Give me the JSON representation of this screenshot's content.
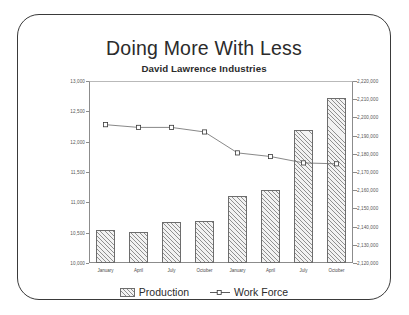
{
  "chart_data": {
    "type": "bar",
    "title": "Doing More With Less",
    "subtitle": "David Lawrence Industries",
    "xlabel": "",
    "ylabel": "",
    "grid": false,
    "legend_position": "bottom",
    "categories": [
      "January",
      "April",
      "July",
      "October",
      "January",
      "April",
      "July",
      "October"
    ],
    "yaxis_left": {
      "label": "Production",
      "min": 10000,
      "max": 13000,
      "step": 500,
      "ticks": [
        "10,000",
        "10,500",
        "11,000",
        "11,500",
        "12,000",
        "12,500",
        "13,000"
      ],
      "tick_values": [
        10000,
        10500,
        11000,
        11500,
        12000,
        12500,
        13000
      ]
    },
    "yaxis_right": {
      "label": "Work Force",
      "min": 2120000,
      "max": 2220000,
      "step": 10000,
      "ticks": [
        "2,120,000",
        "2,130,000",
        "2,140,000",
        "2,150,000",
        "2,160,000",
        "2,170,000",
        "2,180,000",
        "2,190,000",
        "2,200,000",
        "2,210,000",
        "2,220,000"
      ],
      "tick_values": [
        2120000,
        2130000,
        2140000,
        2150000,
        2160000,
        2170000,
        2180000,
        2190000,
        2200000,
        2210000,
        2220000
      ]
    },
    "series": [
      {
        "name": "Production",
        "type": "bar",
        "axis": "left",
        "values": [
          10540,
          10510,
          10670,
          10700,
          11110,
          11210,
          12200,
          12720
        ]
      },
      {
        "name": "Work Force",
        "type": "line",
        "axis": "right",
        "values": [
          2196000,
          2194500,
          2194500,
          2192000,
          2180500,
          2178500,
          2175000,
          2174500
        ]
      }
    ]
  },
  "legend": {
    "production_label": "Production",
    "workforce_label": "Work Force"
  }
}
